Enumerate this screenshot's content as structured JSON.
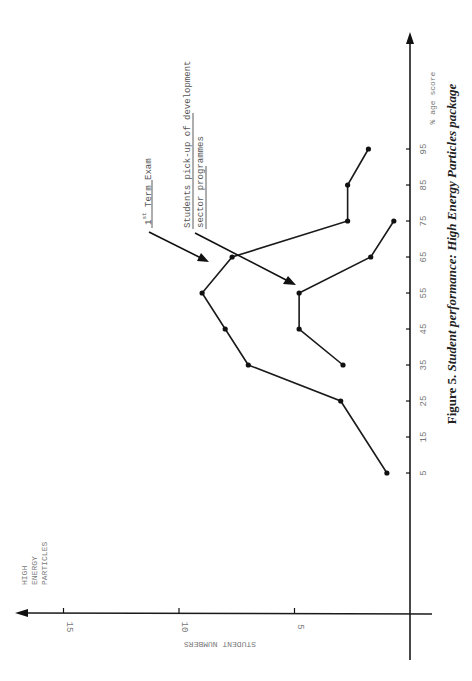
{
  "chart_data": {
    "type": "line",
    "title": "Figure 5. Student performance: High Energy Particles package",
    "caption_prefix": "Figure 5.",
    "caption_rest": "Student performance: High Energy Particles package",
    "subject_label": [
      "HIGH",
      "ENERGY",
      "PARTICLES"
    ],
    "xlabel": "% age score",
    "ylabel": "STUDENT NUMBERS",
    "x_ticks": [
      5,
      15,
      25,
      35,
      45,
      55,
      65,
      75,
      85,
      95
    ],
    "y_ticks": [
      5,
      10,
      15
    ],
    "xlim": [
      0,
      100
    ],
    "ylim": [
      0,
      16
    ],
    "grid": false,
    "orientation": "rotated 90° counter-clockwise (score axis vertical, increasing upward)",
    "series": [
      {
        "name": "1st Term Exam",
        "x": [
          5,
          25,
          35,
          45,
          55,
          65,
          75,
          85,
          95
        ],
        "values": [
          1,
          3,
          7,
          8,
          9,
          7.7,
          2.7,
          2.7,
          1.8
        ]
      },
      {
        "name": "Students pick-up of development sector programmes",
        "x": [
          35,
          45,
          55,
          65,
          75
        ],
        "values": [
          2.9,
          4.8,
          4.8,
          1.7,
          0.7
        ]
      }
    ],
    "annotations": [
      {
        "text_base": "1",
        "text_sup": "st",
        "text_rest": " Term Exam",
        "target_series": 0
      },
      {
        "line1": "Students pick-up of development",
        "line2": "sector programmes",
        "target_series": 1
      }
    ]
  }
}
